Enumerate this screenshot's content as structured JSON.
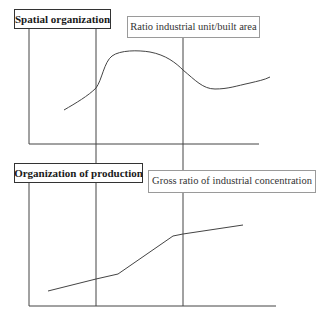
{
  "diagram": {
    "top_panel": {
      "title": "Spatial organization",
      "series_label": "Ratio industrial unit/built area",
      "curve_shape": "smooth rise, plateau, decline, slight recovery"
    },
    "bottom_panel": {
      "title": "Organization of production",
      "series_label": "Gross ratio of industrial concentration",
      "curve_shape": "piecewise linear, monotonically increasing"
    },
    "phase_dividers": 2,
    "colors": {
      "line": "#444444",
      "title_border": "#333333",
      "label_border": "#9a9a9a",
      "background": "#ffffff"
    }
  }
}
